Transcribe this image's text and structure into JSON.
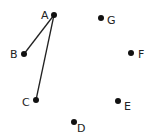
{
  "diagram": {
    "type": "graph",
    "nodes": [
      {
        "id": "A",
        "label": "A",
        "x": 54,
        "y": 15,
        "lx": 41,
        "ly": 19
      },
      {
        "id": "B",
        "label": "B",
        "x": 24,
        "y": 54,
        "lx": 10,
        "ly": 58
      },
      {
        "id": "C",
        "label": "C",
        "x": 36,
        "y": 100,
        "lx": 22,
        "ly": 106
      },
      {
        "id": "D",
        "label": "D",
        "x": 74,
        "y": 122,
        "lx": 78,
        "ly": 132
      },
      {
        "id": "E",
        "label": "E",
        "x": 118,
        "y": 101,
        "lx": 125,
        "ly": 110
      },
      {
        "id": "F",
        "label": "F",
        "x": 131,
        "y": 53,
        "lx": 139,
        "ly": 58
      },
      {
        "id": "G",
        "label": "G",
        "x": 101,
        "y": 18,
        "lx": 108,
        "ly": 24
      }
    ],
    "edges": [
      {
        "from": "A",
        "to": "B"
      },
      {
        "from": "A",
        "to": "C"
      }
    ],
    "colors": {
      "node": "#111111",
      "edge": "#222222",
      "label": "#222222"
    }
  }
}
